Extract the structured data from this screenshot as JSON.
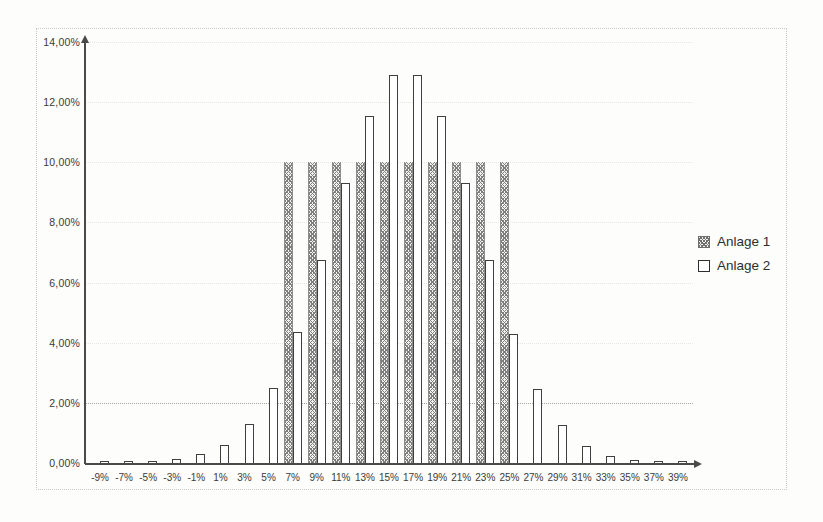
{
  "chart_data": {
    "type": "bar",
    "title": "",
    "xlabel": "",
    "ylabel": "",
    "categories": [
      "-9%",
      "-7%",
      "-5%",
      "-3%",
      "-1%",
      "1%",
      "3%",
      "5%",
      "7%",
      "9%",
      "11%",
      "13%",
      "15%",
      "17%",
      "19%",
      "21%",
      "23%",
      "25%",
      "27%",
      "29%",
      "31%",
      "33%",
      "35%",
      "37%",
      "39%"
    ],
    "series": [
      {
        "name": "Anlage 1",
        "style": "hatched",
        "values": [
          0,
          0,
          0,
          0,
          0,
          0,
          0,
          0,
          10.0,
          10.0,
          10.0,
          10.0,
          10.0,
          10.0,
          10.0,
          10.0,
          10.0,
          10.0,
          0,
          0,
          0,
          0,
          0,
          0,
          0
        ]
      },
      {
        "name": "Anlage 2",
        "style": "outline",
        "values": [
          0.03,
          0.04,
          0.06,
          0.12,
          0.3,
          0.6,
          1.3,
          2.5,
          4.35,
          6.75,
          9.3,
          11.55,
          12.9,
          12.9,
          11.55,
          9.3,
          6.75,
          4.3,
          2.45,
          1.25,
          0.55,
          0.22,
          0.1,
          0.05,
          0.02
        ]
      }
    ],
    "ylim": [
      0,
      14
    ],
    "y_tick_values": [
      0,
      2,
      4,
      6,
      8,
      10,
      12,
      14
    ],
    "y_tick_labels": [
      "0,00%",
      "2,00%",
      "4,00%",
      "6,00%",
      "8,00%",
      "10,00%",
      "12,00%",
      "14,00%"
    ],
    "grid": "horizontal-dotted",
    "gridline_emphasized_value": 2,
    "legend_position": "right"
  },
  "legend": {
    "items": [
      {
        "label": "Anlage 1",
        "swatch": "hatched"
      },
      {
        "label": "Anlage 2",
        "swatch": "outline"
      }
    ]
  }
}
